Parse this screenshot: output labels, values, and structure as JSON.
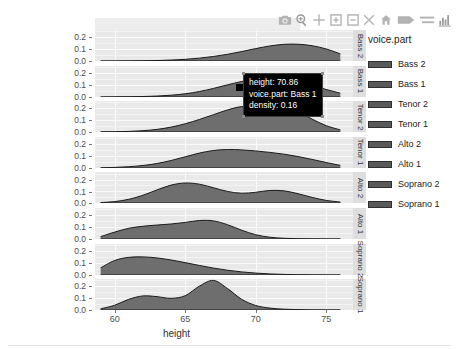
{
  "modebar": {
    "buttons": [
      {
        "name": "camera-icon",
        "label": "Download plot as a png"
      },
      {
        "name": "zoom-icon",
        "label": "Zoom"
      },
      {
        "name": "pan-icon",
        "label": "Pan"
      },
      {
        "name": "zoom-in-icon",
        "label": "Zoom in"
      },
      {
        "name": "zoom-out-icon",
        "label": "Zoom out"
      },
      {
        "name": "autoscale-icon",
        "label": "Autoscale"
      },
      {
        "name": "reset-axes-icon",
        "label": "Reset axes"
      },
      {
        "name": "toggle-spike-lines-icon",
        "label": "Toggle Spike Lines"
      },
      {
        "name": "hover-compare-icon",
        "label": "Compare data on hover"
      },
      {
        "name": "plotly-logo-icon",
        "label": "Produced with Plotly"
      }
    ]
  },
  "axes": {
    "x": {
      "title": "height",
      "ticks": [
        "60",
        "65",
        "70",
        "75"
      ],
      "tickvals": [
        60,
        65,
        70,
        75
      ],
      "range": [
        58.6,
        76.9
      ]
    },
    "y": {
      "title": "",
      "ticks": [
        "0.0",
        "0.1",
        "0.2"
      ],
      "tickvals": [
        0.0,
        0.1,
        0.2
      ],
      "range": [
        0.0,
        0.26
      ]
    }
  },
  "legend": {
    "title": "voice.part",
    "items": [
      {
        "label": "Bass 2",
        "color": "#5a5a5a"
      },
      {
        "label": "Bass 1",
        "color": "#5a5a5a"
      },
      {
        "label": "Tenor 2",
        "color": "#5a5a5a"
      },
      {
        "label": "Tenor 1",
        "color": "#5a5a5a"
      },
      {
        "label": "Alto 2",
        "color": "#5a5a5a"
      },
      {
        "label": "Alto 1",
        "color": "#5a5a5a"
      },
      {
        "label": "Soprano 2",
        "color": "#5a5a5a"
      },
      {
        "label": "Soprano 1",
        "color": "#5a5a5a"
      }
    ]
  },
  "tooltip": {
    "visible": true,
    "lines": [
      "height: 70.86",
      "voice.part: Bass 1",
      "density: 0.16"
    ]
  },
  "chart_data": {
    "type": "area",
    "title": "",
    "xlabel": "height",
    "ylabel": "",
    "xlim": [
      58.6,
      76.9
    ],
    "ylim": [
      0.0,
      0.26
    ],
    "grid": true,
    "legend_position": "right",
    "facet_variable": "voice.part",
    "facet_order": [
      "Bass 2",
      "Bass 1",
      "Tenor 2",
      "Tenor 1",
      "Alto 2",
      "Alto 1",
      "Soprano 2",
      "Soprano 1"
    ],
    "fill_color": "#6e6e6e",
    "line_color": "#1a1a1a",
    "panel_background": "#e9e9e9",
    "grid_color": "#fbfbfb",
    "x": [
      59,
      60,
      61,
      62,
      63,
      64,
      65,
      66,
      67,
      68,
      69,
      70,
      71,
      72,
      73,
      74,
      75,
      76
    ],
    "series": [
      {
        "name": "Bass 2",
        "values": [
          0.0,
          0.0,
          0.001,
          0.002,
          0.004,
          0.008,
          0.014,
          0.024,
          0.038,
          0.056,
          0.079,
          0.104,
          0.126,
          0.14,
          0.141,
          0.128,
          0.101,
          0.06
        ]
      },
      {
        "name": "Bass 1",
        "values": [
          0.0,
          0.001,
          0.002,
          0.004,
          0.008,
          0.015,
          0.027,
          0.046,
          0.072,
          0.102,
          0.13,
          0.15,
          0.158,
          0.15,
          0.128,
          0.097,
          0.063,
          0.032
        ]
      },
      {
        "name": "Tenor 2",
        "values": [
          0.001,
          0.002,
          0.005,
          0.011,
          0.022,
          0.041,
          0.069,
          0.105,
          0.145,
          0.185,
          0.213,
          0.21,
          0.19,
          0.197,
          0.168,
          0.108,
          0.053,
          0.018
        ]
      },
      {
        "name": "Tenor 1",
        "values": [
          0.002,
          0.005,
          0.011,
          0.021,
          0.038,
          0.063,
          0.094,
          0.125,
          0.147,
          0.155,
          0.152,
          0.143,
          0.131,
          0.116,
          0.096,
          0.072,
          0.046,
          0.022
        ]
      },
      {
        "name": "Alto 2",
        "values": [
          0.004,
          0.012,
          0.031,
          0.065,
          0.11,
          0.15,
          0.168,
          0.158,
          0.128,
          0.097,
          0.082,
          0.09,
          0.105,
          0.102,
          0.078,
          0.047,
          0.022,
          0.008
        ]
      },
      {
        "name": "Alto 1",
        "values": [
          0.02,
          0.058,
          0.09,
          0.107,
          0.117,
          0.126,
          0.139,
          0.155,
          0.152,
          0.12,
          0.074,
          0.036,
          0.015,
          0.006,
          0.002,
          0.001,
          0.0,
          0.0
        ]
      },
      {
        "name": "Soprano 2",
        "values": [
          0.06,
          0.122,
          0.148,
          0.152,
          0.143,
          0.126,
          0.104,
          0.08,
          0.058,
          0.04,
          0.026,
          0.016,
          0.009,
          0.005,
          0.002,
          0.001,
          0.0,
          0.0
        ]
      },
      {
        "name": "Soprano 1",
        "values": [
          0.01,
          0.04,
          0.09,
          0.118,
          0.112,
          0.098,
          0.12,
          0.2,
          0.248,
          0.18,
          0.09,
          0.038,
          0.016,
          0.007,
          0.003,
          0.001,
          0.0,
          0.0
        ]
      }
    ]
  }
}
